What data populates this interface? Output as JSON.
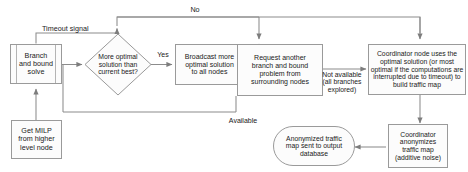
{
  "diagram": {
    "type": "flowchart",
    "stroke_color": "#8c8c8c",
    "text_color": "#1a1a1a",
    "fill_color": "#fcfcfc",
    "nodes": [
      {
        "id": "branch_and_bound_solve",
        "shape": "predefined-process",
        "text": "Branch\nand bound\nsolve",
        "font_size": 7.2
      },
      {
        "id": "get_milp",
        "shape": "process",
        "text": "Get MILP\nfrom higher\nlevel node",
        "font_size": 7.2
      },
      {
        "id": "more_optimal_decision",
        "shape": "decision",
        "text": "More optimal\nsolution than\ncurrent best?",
        "font_size": 6.8
      },
      {
        "id": "broadcast_solution",
        "shape": "process",
        "text": "Broadcast more\noptimal solution\nto all nodes",
        "font_size": 7.0
      },
      {
        "id": "request_another_problem",
        "shape": "process",
        "text": "Request another\nbranch and bound\nproblem from\nsurrounding nodes",
        "font_size": 7.0
      },
      {
        "id": "coordinator_builds_map",
        "shape": "process",
        "text": "Coordinator node uses the\noptimal solution (or most\noptimal if the computations are\ninterrupted due to timeout) to\nbuild traffic map",
        "font_size": 6.8
      },
      {
        "id": "coordinator_anonymizes",
        "shape": "process",
        "text": "Coordinator\nanonymizes\ntraffic map\n(additive noise)",
        "font_size": 6.8
      },
      {
        "id": "anonymized_output",
        "shape": "stadium",
        "text": "Anonymized traffic\nmap sent to output\ndatabase",
        "font_size": 6.8
      }
    ],
    "edge_labels": [
      {
        "id": "label_no",
        "text": "No",
        "font_size": 7.2
      },
      {
        "id": "label_timeout_signal",
        "text": "Timeout signal",
        "font_size": 7.2
      },
      {
        "id": "label_yes",
        "text": "Yes",
        "font_size": 7.0
      },
      {
        "id": "label_not_available",
        "text": "Not available\n(all branches\nexplored)",
        "font_size": 6.8
      },
      {
        "id": "label_available",
        "text": "Available",
        "font_size": 7.0
      }
    ]
  }
}
